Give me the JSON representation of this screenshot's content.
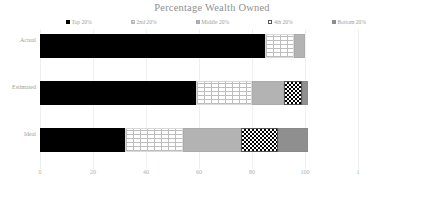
{
  "chart_data": {
    "type": "bar",
    "orientation": "horizontal",
    "stacked": true,
    "title": "Percentage Wealth Owned",
    "xlabel": "",
    "ylabel": "",
    "xlim": [
      0,
      120
    ],
    "xticks": [
      0,
      20,
      40,
      60,
      80,
      100,
      120
    ],
    "xtick_labels": [
      "0",
      "20",
      "40",
      "60",
      "80",
      "100",
      "1"
    ],
    "grid": true,
    "grid_axis": "x",
    "legend_position": "top",
    "categories": [
      "Actual",
      "Estimated",
      "Ideal"
    ],
    "series": [
      {
        "name": "Top 20%",
        "values": [
          85,
          59,
          32
        ],
        "fill": "solid-black",
        "color": "#000000"
      },
      {
        "name": "2nd 20%",
        "values": [
          11,
          21,
          22
        ],
        "fill": "brick-hatch",
        "color": "#ffffff"
      },
      {
        "name": "Middle 20%",
        "values": [
          4,
          12,
          22
        ],
        "fill": "solid-gray",
        "color": "#b3b3b3"
      },
      {
        "name": "4th 20%",
        "values": [
          0,
          7,
          14
        ],
        "fill": "checkerboard",
        "color": "#000000"
      },
      {
        "name": "Bottom 20%",
        "values": [
          0,
          2,
          11
        ],
        "fill": "solid-dark-gray",
        "color": "#8f8f8f"
      }
    ]
  },
  "title": {
    "text": "Percentage Wealth Owned"
  },
  "legend": {
    "items": [
      {
        "label": "Top 20%"
      },
      {
        "label": "2nd 20%"
      },
      {
        "label": "Middle 20%"
      },
      {
        "label": "4th 20%"
      },
      {
        "label": "Bottom 20%"
      }
    ]
  },
  "axes": {
    "x_tick_labels": [
      "0",
      "20",
      "40",
      "60",
      "80",
      "100",
      "1"
    ],
    "category_labels": [
      "Actual",
      "Estimated",
      "Ideal"
    ]
  }
}
